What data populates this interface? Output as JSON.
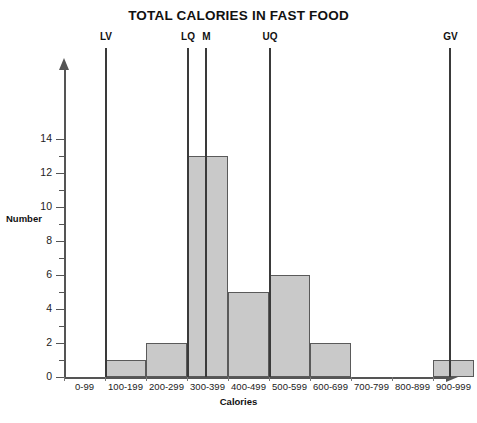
{
  "chart_data": {
    "type": "bar",
    "title": "TOTAL CALORIES IN FAST FOOD",
    "xlabel": "Calories",
    "ylabel": "Number",
    "categories": [
      "0-99",
      "100-199",
      "200-299",
      "300-399",
      "400-499",
      "500-599",
      "600-699",
      "700-799",
      "800-899",
      "900-999"
    ],
    "values": [
      0,
      1,
      2,
      13,
      5,
      6,
      2,
      0,
      0,
      1
    ],
    "ylim": [
      0,
      15
    ],
    "y_major_ticks": [
      0,
      2,
      4,
      6,
      8,
      10,
      12,
      14
    ],
    "y_minor_ticks": [
      1,
      3,
      5,
      7,
      9,
      11,
      13
    ],
    "grid": false,
    "legend": "none",
    "annotations": [
      {
        "label": "LV",
        "category_edge": "100-199 left",
        "value_calories": 100
      },
      {
        "label": "LQ",
        "category_edge": "300-399 left",
        "value_calories": 300
      },
      {
        "label": "M",
        "category_edge": "300-399 mid",
        "value_calories": 345
      },
      {
        "label": "UQ",
        "category_edge": "500-599 left",
        "value_calories": 500
      },
      {
        "label": "GV",
        "category_edge": "900-999 mid",
        "value_calories": 940
      }
    ],
    "bar_fill_color": "#c9c9c9",
    "bar_edge_color": "#5a5a5a",
    "axis_color": "#555555",
    "marker_color": "#3a3a3a"
  }
}
